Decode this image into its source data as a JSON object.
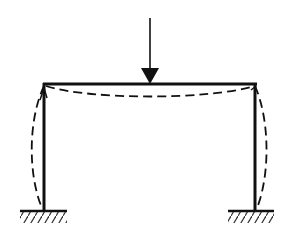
{
  "diagram": {
    "type": "portal-frame-deflection",
    "description": "Fixed-base portal frame under a central point load with dashed deflected shape",
    "colors": {
      "stroke": "#111111",
      "background": "#ffffff"
    },
    "load": {
      "x": 150,
      "y_top": 18,
      "y_tip": 84,
      "head_top": 68
    },
    "beam": {
      "y": 84,
      "x_left": 44,
      "x_right": 256
    },
    "columns": [
      {
        "name": "left",
        "x": 44,
        "y_top": 84,
        "y_bottom": 210
      },
      {
        "name": "right",
        "x": 255,
        "y_top": 84,
        "y_bottom": 210
      }
    ],
    "supports": [
      {
        "name": "left-fixed-support",
        "x1": 20,
        "x2": 67,
        "y": 210
      },
      {
        "name": "right-fixed-support",
        "x1": 228,
        "x2": 274,
        "y": 210
      }
    ],
    "deflected_shape": {
      "beam_sag_y": 98,
      "left_column_bulge_x": 32,
      "right_column_bulge_x": 266
    }
  }
}
